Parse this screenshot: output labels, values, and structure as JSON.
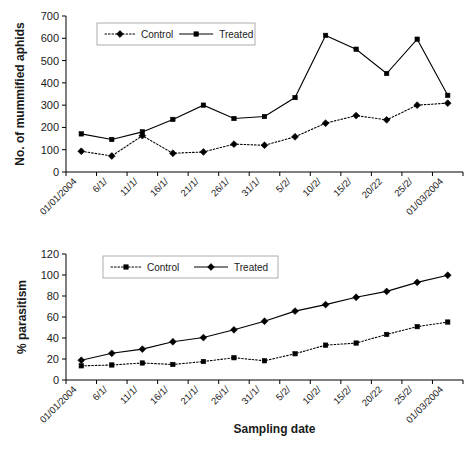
{
  "chart_data": [
    {
      "type": "line",
      "panel": "top",
      "title": "",
      "xlabel": "",
      "ylabel": "No. of mummified aphids",
      "ylim": [
        0,
        700
      ],
      "ytick_step": 100,
      "yticks": [
        0,
        100,
        200,
        300,
        400,
        500,
        600,
        700
      ],
      "grid": false,
      "legend_position": "top-left-inside",
      "categories": [
        "01/01/2004",
        "6/1/",
        "11/1/",
        "16/1/",
        "21/1/",
        "26/1/",
        "31/1/",
        "5/2/",
        "10/2/",
        "15/2/",
        "20/22",
        "25/2/",
        "01/03/2004"
      ],
      "series": [
        {
          "name": "Control",
          "marker": "diamond",
          "linestyle": "dotted",
          "values": [
            93,
            72,
            163,
            84,
            90,
            125,
            120,
            158,
            219,
            253,
            234,
            300,
            309
          ]
        },
        {
          "name": "Treated",
          "marker": "square",
          "linestyle": "solid",
          "values": [
            171,
            146,
            180,
            236,
            300,
            240,
            249,
            334,
            613,
            551,
            442,
            596,
            344
          ]
        }
      ]
    },
    {
      "type": "line",
      "panel": "bottom",
      "title": "",
      "xlabel": "Sampling date",
      "ylabel": "% parasitism",
      "ylim": [
        0,
        120
      ],
      "ytick_step": 20,
      "yticks": [
        0,
        20,
        40,
        60,
        80,
        100,
        120
      ],
      "grid": false,
      "legend_position": "top-left-inside",
      "categories": [
        "01/01/2004",
        "6/1/",
        "11/1/",
        "16/1/",
        "21/1/",
        "26/1/",
        "31/1/",
        "5/2/",
        "10/2/",
        "15/2/",
        "20/22",
        "25/2/",
        "01/03/2004"
      ],
      "series": [
        {
          "name": "Control",
          "marker": "square",
          "linestyle": "dotted",
          "values": [
            13.5,
            14.3,
            16.2,
            14.8,
            17.6,
            21.2,
            18.3,
            25.0,
            33.2,
            35.2,
            43.4,
            50.8,
            55.2
          ]
        },
        {
          "name": "Treated",
          "marker": "diamond",
          "linestyle": "solid",
          "values": [
            18.8,
            25.4,
            29.4,
            36.4,
            40.4,
            47.8,
            56.0,
            65.6,
            71.8,
            78.8,
            84.4,
            93.0,
            99.8
          ]
        }
      ]
    }
  ],
  "top_chart": {
    "ylabel": "No. of mummified aphids",
    "legend": {
      "control_label": "Control",
      "treated_label": "Treated"
    }
  },
  "bottom_chart": {
    "ylabel": "% parasitism",
    "xlabel": "Sampling date",
    "legend": {
      "control_label": "Control",
      "treated_label": "Treated"
    }
  }
}
